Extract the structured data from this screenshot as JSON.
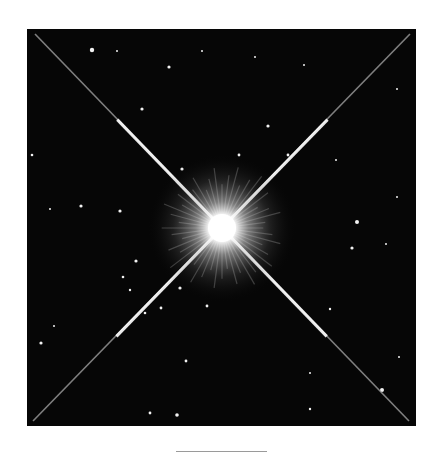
{
  "image": {
    "subject": "bright star with four diffraction spikes in a star field",
    "background_color": "#060606",
    "center_star": {
      "x": 195,
      "y": 199,
      "core_radius": 14,
      "halo_radius": 75
    },
    "spikes": [
      {
        "x1": 8,
        "y1": 5,
        "x2": 382,
        "y2": 392
      },
      {
        "x1": 383,
        "y1": 5,
        "x2": 6,
        "y2": 392
      }
    ],
    "stars": [
      {
        "x": 65,
        "y": 21,
        "r": 2.2
      },
      {
        "x": 90,
        "y": 22,
        "r": 1
      },
      {
        "x": 142,
        "y": 38,
        "r": 1.6
      },
      {
        "x": 115,
        "y": 80,
        "r": 1.6
      },
      {
        "x": 241,
        "y": 97,
        "r": 1.6
      },
      {
        "x": 212,
        "y": 126,
        "r": 1.4
      },
      {
        "x": 261,
        "y": 126,
        "r": 1.4
      },
      {
        "x": 155,
        "y": 140,
        "r": 1.6
      },
      {
        "x": 5,
        "y": 126,
        "r": 1.3
      },
      {
        "x": 54,
        "y": 177,
        "r": 1.6
      },
      {
        "x": 93,
        "y": 182,
        "r": 1.6
      },
      {
        "x": 23,
        "y": 180,
        "r": 1
      },
      {
        "x": 330,
        "y": 193,
        "r": 2
      },
      {
        "x": 325,
        "y": 219,
        "r": 1.6
      },
      {
        "x": 359,
        "y": 215,
        "r": 1
      },
      {
        "x": 309,
        "y": 131,
        "r": 1
      },
      {
        "x": 370,
        "y": 168,
        "r": 1
      },
      {
        "x": 109,
        "y": 232,
        "r": 1.6
      },
      {
        "x": 96,
        "y": 248,
        "r": 1.3
      },
      {
        "x": 103,
        "y": 261,
        "r": 1.2
      },
      {
        "x": 153,
        "y": 259,
        "r": 1.6
      },
      {
        "x": 180,
        "y": 277,
        "r": 1.4
      },
      {
        "x": 134,
        "y": 279,
        "r": 1.4
      },
      {
        "x": 118,
        "y": 284,
        "r": 1.3
      },
      {
        "x": 14,
        "y": 314,
        "r": 1.6
      },
      {
        "x": 159,
        "y": 332,
        "r": 1.4
      },
      {
        "x": 355,
        "y": 361,
        "r": 2
      },
      {
        "x": 283,
        "y": 344,
        "r": 1
      },
      {
        "x": 123,
        "y": 384,
        "r": 1.4
      },
      {
        "x": 150,
        "y": 386,
        "r": 1.8
      },
      {
        "x": 283,
        "y": 380,
        "r": 1.2
      },
      {
        "x": 372,
        "y": 328,
        "r": 1
      },
      {
        "x": 303,
        "y": 280,
        "r": 1.2
      },
      {
        "x": 27,
        "y": 297,
        "r": 1
      },
      {
        "x": 228,
        "y": 28,
        "r": 1
      },
      {
        "x": 175,
        "y": 22,
        "r": 1
      },
      {
        "x": 277,
        "y": 36,
        "r": 1
      },
      {
        "x": 370,
        "y": 60,
        "r": 1
      }
    ]
  },
  "caption_rule": {
    "visible": true
  }
}
